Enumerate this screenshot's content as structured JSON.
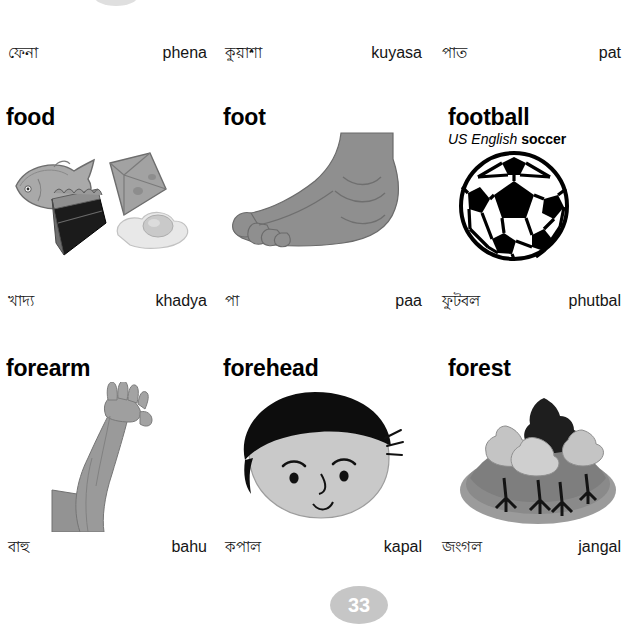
{
  "page": {
    "number": "33",
    "language": "Bengali",
    "script_note": "Bengali headwords with romanized transliteration"
  },
  "continued_row": {
    "items": [
      {
        "native": "ফেনা",
        "roman": "phena"
      },
      {
        "native": "কুয়াশা",
        "roman": "kuyasa"
      },
      {
        "native": "পাত",
        "roman": "pat"
      }
    ]
  },
  "rows": [
    {
      "entries": [
        {
          "headword": "food",
          "variant_label": null,
          "variant_word": null,
          "art": "food-illustration",
          "native": "খাদ্য",
          "roman": "khadya"
        },
        {
          "headword": "foot",
          "variant_label": null,
          "variant_word": null,
          "art": "foot-illustration",
          "native": "পা",
          "roman": "paa"
        },
        {
          "headword": "football",
          "variant_label": "US English",
          "variant_word": "soccer",
          "art": "football-illustration",
          "native": "ফুটবল",
          "roman": "phutbal"
        }
      ]
    },
    {
      "entries": [
        {
          "headword": "forearm",
          "variant_label": null,
          "variant_word": null,
          "art": "forearm-illustration",
          "native": "বাহু",
          "roman": "bahu"
        },
        {
          "headword": "forehead",
          "variant_label": null,
          "variant_word": null,
          "art": "forehead-illustration",
          "native": "কপাল",
          "roman": "kapal"
        },
        {
          "headword": "forest",
          "variant_label": null,
          "variant_word": null,
          "art": "forest-illustration",
          "native": "জংগল",
          "roman": "jangal"
        }
      ]
    }
  ],
  "colors": {
    "page_badge": "#c6c6c6",
    "page_badge_text": "#ffffff",
    "text": "#111111",
    "art_gray": "#8c8c8c",
    "art_gray_light": "#bdbdbd",
    "art_black": "#111111"
  }
}
